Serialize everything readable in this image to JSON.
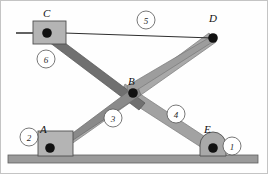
{
  "figure": {
    "background_color": "#fefefe",
    "border_color": "#bcbcbc",
    "width": 268,
    "height": 174
  },
  "palette": {
    "link_dark": "#6f6f6f",
    "link_light": "#a8a8a8",
    "link_mid": "#8d8d8d",
    "block_fill": "#b3b3b3",
    "ground_fill": "#9a9a9a",
    "ground_stroke": "#6a6a6a",
    "joint_fill": "#111111",
    "rail_stroke": "#3a3a3a",
    "outline": "#4a4a4a",
    "callout_stroke": "#555555",
    "text_color": "#111111"
  },
  "joints": [
    {
      "id": "A",
      "label": "A",
      "x": 50,
      "y": 148,
      "label_x": 40,
      "label_y": 133,
      "radius": 4.6
    },
    {
      "id": "B",
      "label": "B",
      "x": 133,
      "y": 93,
      "label_x": 128,
      "label_y": 84,
      "radius": 4.6
    },
    {
      "id": "C",
      "label": "C",
      "x": 47,
      "y": 33,
      "label_x": 44,
      "label_y": 17,
      "radius": 4.6
    },
    {
      "id": "D",
      "label": "D",
      "x": 213,
      "y": 38,
      "label_x": 210,
      "label_y": 22,
      "radius": 4.6
    },
    {
      "id": "E",
      "label": "E",
      "x": 213,
      "y": 148,
      "label_x": 204,
      "label_y": 133,
      "radius": 4.6
    }
  ],
  "links": [
    {
      "id": "1",
      "number": "1",
      "name": "ground-pivot-block-E",
      "callout_x": 232,
      "callout_y": 146,
      "callout_r": 9
    },
    {
      "id": "2",
      "number": "2",
      "name": "ground-pivot-block-A",
      "callout_x": 29,
      "callout_y": 137,
      "callout_r": 9
    },
    {
      "id": "3",
      "number": "3",
      "name": "link-C-to-B",
      "callout_x": 113,
      "callout_y": 118,
      "callout_r": 9
    },
    {
      "id": "4",
      "number": "4",
      "name": "link-B-to-E",
      "callout_x": 176,
      "callout_y": 114,
      "callout_r": 9
    },
    {
      "id": "5",
      "number": "5",
      "name": "link-C-to-D-slider-rail",
      "callout_x": 146,
      "callout_y": 20,
      "callout_r": 9
    },
    {
      "id": "6",
      "number": "6",
      "name": "slider-block-C",
      "callout_x": 46,
      "callout_y": 59,
      "callout_r": 9
    }
  ],
  "ground": {
    "name": "ground-surface",
    "x": 8,
    "y": 155,
    "width": 250,
    "height": 8
  },
  "rail": {
    "name": "horizontal-rail",
    "x1": 16,
    "y1": 33,
    "x2": 90,
    "y2": 33
  },
  "blocks": [
    {
      "name": "slider-block-C",
      "x": 33,
      "y": 21,
      "width": 33,
      "height": 23
    },
    {
      "name": "fixed-block-A",
      "x": 38,
      "y": 131,
      "width": 35,
      "height": 25
    },
    {
      "name": "fixed-block-E",
      "x": 200,
      "y": 132,
      "width": 27,
      "height": 24
    }
  ],
  "bodies": [
    {
      "name": "link-3-C-to-B-extension",
      "color_key": "link_dark",
      "points": "47,29 143,102 138,109 47,38"
    },
    {
      "name": "link-A-to-D-long",
      "color_key": "link_light",
      "points": "50,152 213,34 213,42 52,156"
    },
    {
      "name": "link-B-to-E",
      "color_key": "link_light",
      "points": "124,86 215,145 211,152 121,94"
    }
  ]
}
